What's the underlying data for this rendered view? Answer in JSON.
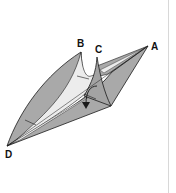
{
  "diagram": {
    "type": "origami-fold-step",
    "labels": {
      "a": "A",
      "b": "B",
      "c": "C",
      "d": "D"
    },
    "colors": {
      "paper_fill": "#a9a9a9",
      "paper_light": "#ececec",
      "stroke": "#1a1a1a",
      "background": "#ffffff",
      "edge_line": "#d8d8d8"
    },
    "arrow": {
      "meaning": "fold-down-arrow"
    }
  }
}
